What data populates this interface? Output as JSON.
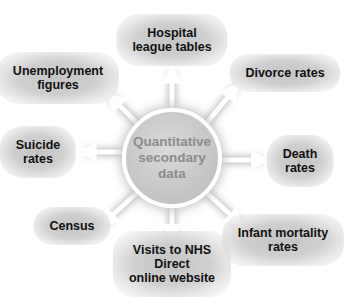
{
  "center": {
    "line1": "Quantitative",
    "line2": "secondary",
    "line3": "data"
  },
  "nodes": {
    "hospital": {
      "line1": "Hospital",
      "line2": "league tables"
    },
    "unemployment": {
      "line1": "Unemployment",
      "line2": "figures"
    },
    "divorce": {
      "line1": "Divorce rates"
    },
    "suicide": {
      "line1": "Suicide",
      "line2": "rates"
    },
    "death": {
      "line1": "Death",
      "line2": "rates"
    },
    "census": {
      "line1": "Census"
    },
    "nhs": {
      "line1": "Visits to NHS",
      "line2": "Direct",
      "line3": "online website"
    },
    "infant": {
      "line1": "Infant mortality",
      "line2": "rates"
    }
  },
  "colors": {
    "arrow": "#ffffff",
    "arrow_glow": "#bdbdbd",
    "node_fill": "#c8c8c8",
    "center_text": "#8c8c8c",
    "node_text": "#111111"
  }
}
